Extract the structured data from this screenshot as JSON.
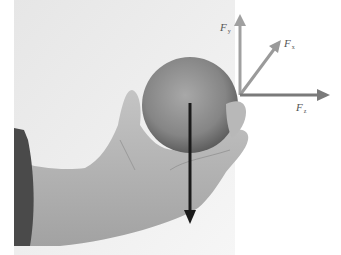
{
  "figure": {
    "axes": {
      "origin": {
        "x": 240,
        "y": 95
      },
      "vectors": [
        {
          "id": "Fy",
          "label": "F",
          "subscript": "y",
          "direction": "up",
          "color": "#a0a0a0"
        },
        {
          "id": "Fx",
          "label": "F",
          "subscript": "x",
          "direction": "diagonal-up-right",
          "color": "#9a9a9a"
        },
        {
          "id": "Fz",
          "label": "F",
          "subscript": "z",
          "direction": "right",
          "color": "#7a7a7a"
        }
      ]
    },
    "weight_vector": {
      "direction": "down",
      "color": "#1a1a1a"
    },
    "colors": {
      "background": "#ffffff",
      "wall": "#ececec",
      "orange": "#8a8a8a",
      "skin": "#b5b5b5",
      "sleeve": "#4a4a4a"
    }
  }
}
